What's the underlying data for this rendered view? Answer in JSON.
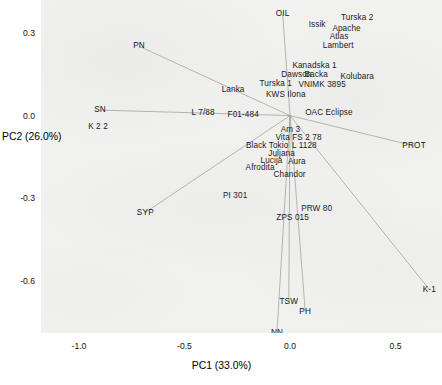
{
  "chart_data": {
    "type": "scatter",
    "title": "",
    "xlabel": "PC1 (33.0%)",
    "ylabel": "PC2 (26.0%)",
    "xlim": [
      -1.18,
      0.72
    ],
    "ylim": [
      -0.79,
      0.42
    ],
    "xticks": [
      -1.0,
      -0.5,
      0.0,
      0.5
    ],
    "xticklabels": [
      "-1.0",
      "-0.5",
      "0.0",
      "0.5"
    ],
    "yticks": [
      0.3,
      0.0,
      -0.3,
      -0.6
    ],
    "yticklabels": [
      "0.3",
      "0.0",
      "-0.3",
      "-0.6"
    ],
    "grid": false,
    "legend": false,
    "background": "#f1f1f0",
    "origin": [
      0.0,
      0.0
    ],
    "samples": [
      {
        "label": "OIL",
        "x": -0.035,
        "y": 0.368
      },
      {
        "label": "Issik",
        "x": 0.128,
        "y": 0.33
      },
      {
        "label": "Turska 2",
        "x": 0.318,
        "y": 0.356
      },
      {
        "label": "Apache",
        "x": 0.268,
        "y": 0.316
      },
      {
        "label": "Atlas",
        "x": 0.232,
        "y": 0.286
      },
      {
        "label": "Lambert",
        "x": 0.228,
        "y": 0.254
      },
      {
        "label": "PN",
        "x": -0.715,
        "y": 0.252
      },
      {
        "label": "Kanadska 1",
        "x": 0.116,
        "y": 0.182
      },
      {
        "label": "Dawson",
        "x": 0.03,
        "y": 0.146
      },
      {
        "label": "Backa",
        "x": 0.124,
        "y": 0.146
      },
      {
        "label": "Kolubara",
        "x": 0.318,
        "y": 0.14
      },
      {
        "label": "Turska 1",
        "x": -0.068,
        "y": 0.116
      },
      {
        "label": "VNIMK 3895",
        "x": 0.152,
        "y": 0.11
      },
      {
        "label": "Lanka",
        "x": -0.27,
        "y": 0.092
      },
      {
        "label": "KWS Ilona",
        "x": -0.02,
        "y": 0.074
      },
      {
        "label": "SN",
        "x": -0.9,
        "y": 0.02
      },
      {
        "label": "L 7/88",
        "x": -0.412,
        "y": 0.008
      },
      {
        "label": "F01-484",
        "x": -0.222,
        "y": 0.004
      },
      {
        "label": "OAC Eclipse",
        "x": 0.184,
        "y": 0.01
      },
      {
        "label": "K 2 2",
        "x": -0.91,
        "y": -0.043
      },
      {
        "label": "Am 3",
        "x": 0.002,
        "y": -0.052
      },
      {
        "label": "Vita FS 2 78",
        "x": 0.04,
        "y": -0.082
      },
      {
        "label": "Black Tokio",
        "x": -0.108,
        "y": -0.112
      },
      {
        "label": "L 1128",
        "x": 0.068,
        "y": -0.112
      },
      {
        "label": "Juljana",
        "x": -0.04,
        "y": -0.14
      },
      {
        "label": "PROT",
        "x": 0.588,
        "y": -0.11
      },
      {
        "label": "Lucija",
        "x": -0.088,
        "y": -0.166
      },
      {
        "label": "Aura",
        "x": 0.032,
        "y": -0.17
      },
      {
        "label": "Afrodita",
        "x": -0.142,
        "y": -0.192
      },
      {
        "label": "Chandor",
        "x": -0.002,
        "y": -0.216
      },
      {
        "label": "PI 301",
        "x": -0.26,
        "y": -0.292
      },
      {
        "label": "SYP",
        "x": -0.686,
        "y": -0.352
      },
      {
        "label": "PRW 80",
        "x": 0.126,
        "y": -0.34
      },
      {
        "label": "ZPS 015",
        "x": 0.012,
        "y": -0.372
      },
      {
        "label": "K-1",
        "x": 0.66,
        "y": -0.632
      },
      {
        "label": "TSW",
        "x": -0.006,
        "y": -0.678
      },
      {
        "label": "PH",
        "x": 0.072,
        "y": -0.712
      },
      {
        "label": "NN",
        "x": -0.062,
        "y": -0.79
      }
    ],
    "loading_vectors": [
      {
        "label": "OIL",
        "x": -0.035,
        "y": 0.368
      },
      {
        "label": "PN",
        "x": -0.715,
        "y": 0.252
      },
      {
        "label": "SN",
        "x": -0.9,
        "y": 0.02
      },
      {
        "label": "SYP",
        "x": -0.686,
        "y": -0.352
      },
      {
        "label": "PROT",
        "x": 0.588,
        "y": -0.11
      },
      {
        "label": "TSW",
        "x": -0.006,
        "y": -0.678
      },
      {
        "label": "PH",
        "x": 0.072,
        "y": -0.712
      },
      {
        "label": "NN",
        "x": -0.062,
        "y": -0.79
      },
      {
        "label": "K-1",
        "x": 0.66,
        "y": -0.632
      }
    ]
  }
}
